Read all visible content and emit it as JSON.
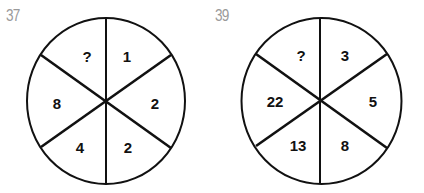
{
  "puzzles": [
    {
      "label": "37",
      "segments": {
        "top_left": "?",
        "top_right": "1",
        "right": "2",
        "bottom_right": "2",
        "bottom_left": "4",
        "left": "8"
      }
    },
    {
      "label": "39",
      "segments": {
        "top_left": "?",
        "top_right": "3",
        "right": "5",
        "bottom_right": "8",
        "bottom_left": "13",
        "left": "22"
      }
    }
  ],
  "colors": {
    "line": "#111111",
    "label": "#9a9a9a",
    "background": "#ffffff"
  }
}
